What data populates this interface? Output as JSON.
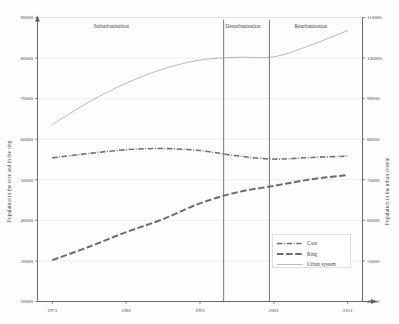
{
  "chart_data": {
    "type": "line",
    "title": "",
    "xlabel": "",
    "ylabel": "Population in the core and in the ring",
    "y2label": "Population in the urban system",
    "x": [
      1971,
      1976,
      1981,
      1986,
      1991,
      1996,
      2001,
      2006,
      2011
    ],
    "xticks": [
      "1971",
      "1981",
      "1991",
      "2001",
      "2011"
    ],
    "xlim": [
      1969,
      2013
    ],
    "ylim": [
      20000,
      90000
    ],
    "yticks": [
      "20000",
      "30000",
      "40000",
      "50000",
      "60000",
      "70000",
      "80000",
      "90000"
    ],
    "y2lim": [
      40000,
      110000
    ],
    "y2ticks": [
      "40000",
      "50000",
      "60000",
      "70000",
      "80000",
      "90000",
      "100000",
      "110000"
    ],
    "grid": true,
    "legend_position": "lower-right",
    "series": [
      {
        "name": "Core",
        "axis": "left",
        "style": "dash-dot",
        "values": [
          55400,
          56500,
          57400,
          57700,
          57200,
          55900,
          55100,
          55500,
          55800
        ]
      },
      {
        "name": "Ring",
        "axis": "left",
        "style": "dashed",
        "values": [
          30200,
          33500,
          37100,
          40300,
          44200,
          46900,
          48500,
          50100,
          51200
        ]
      },
      {
        "name": "Urban system",
        "axis": "right",
        "style": "solid",
        "values": [
          83600,
          89200,
          93800,
          97300,
          99500,
          100200,
          100300,
          103200,
          106800
        ]
      }
    ],
    "annotations": [
      {
        "label": "Suburbanisation",
        "x": 1979.0
      },
      {
        "label": "Desurbanisation",
        "x": 1996.8
      },
      {
        "label": "Reurbanisation",
        "x": 2006.0
      }
    ],
    "dividers": [
      1994.2,
      2000.4
    ]
  },
  "legend": {
    "items": [
      {
        "label": "Core",
        "style": "dash-dot"
      },
      {
        "label": "Ring",
        "style": "dashed"
      },
      {
        "label": "Urban system",
        "style": "solid"
      }
    ]
  }
}
